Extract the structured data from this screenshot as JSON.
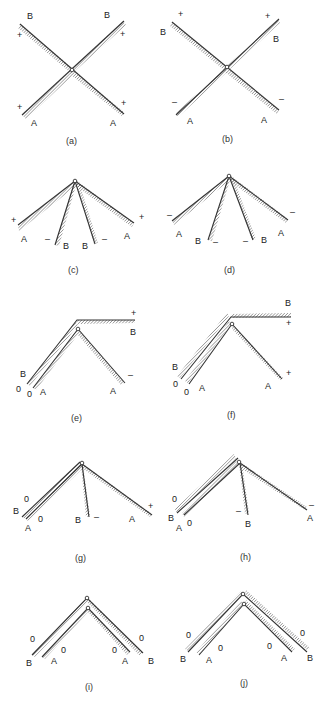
{
  "figure": {
    "panels": [
      {
        "id": "a",
        "caption": "(a)",
        "labels": {
          "top_left": "B",
          "top_right": "B",
          "bottom_left": "A",
          "bottom_right": "A",
          "sign_tl": "+",
          "sign_tr": "+",
          "sign_bl": "+",
          "sign_br": "+"
        }
      },
      {
        "id": "b",
        "caption": "(b)",
        "labels": {
          "top_left": "B",
          "top_right": "B",
          "bottom_left": "A",
          "bottom_right": "A",
          "sign_tl": "+",
          "sign_tr": "+",
          "sign_bl": "–",
          "sign_br": "–"
        }
      },
      {
        "id": "c",
        "caption": "(c)",
        "labels": {
          "a_left": "A",
          "b_left": "B",
          "b_right": "B",
          "a_right": "A",
          "sign_a_left": "+",
          "sign_b_left": "–",
          "sign_b_right": "–",
          "sign_a_right": "+"
        }
      },
      {
        "id": "d",
        "caption": "(d)",
        "labels": {
          "a_left": "A",
          "b_left": "B",
          "b_right": "B",
          "a_right": "A",
          "sign_a_left": "–",
          "sign_b_left": "–",
          "sign_b_right": "–",
          "sign_a_right": "–"
        }
      },
      {
        "id": "e",
        "caption": "(e)",
        "labels": {
          "b_left": "B",
          "a_left": "A",
          "b_right": "B",
          "a_right": "A",
          "sign_b_left": "0",
          "sign_a_left": "0",
          "sign_b_right": "+",
          "sign_a_right": "–"
        }
      },
      {
        "id": "f",
        "caption": "(f)",
        "labels": {
          "b_left": "B",
          "a_left": "A",
          "b_right": "B",
          "a_right": "A",
          "sign_b_left": "0",
          "sign_a_left": "0",
          "sign_b_right": "+",
          "sign_a_right": "+"
        }
      },
      {
        "id": "g",
        "caption": "(g)",
        "labels": {
          "b_left": "B",
          "a_left": "A",
          "b_mid": "B",
          "a_right": "A",
          "sign_b_left": "0",
          "sign_a_left": "0",
          "sign_b_mid": "–",
          "sign_a_right": "+"
        }
      },
      {
        "id": "h",
        "caption": "(h)",
        "labels": {
          "b_left": "B",
          "a_left": "A",
          "b_mid": "B",
          "a_right": "A",
          "sign_b_left": "0",
          "sign_a_left": "0",
          "sign_b_mid": "–",
          "sign_a_right": "–"
        }
      },
      {
        "id": "i",
        "caption": "(i)",
        "labels": {
          "b_left": "B",
          "a_left": "A",
          "a_right": "A",
          "b_right": "B",
          "sign_b_left": "0",
          "sign_a_left": "0",
          "sign_a_right": "0",
          "sign_b_right": "0"
        }
      },
      {
        "id": "j",
        "caption": "(j)",
        "labels": {
          "b_left": "B",
          "a_left": "A",
          "a_right": "A",
          "b_right": "B",
          "sign_b_left": "0",
          "sign_a_left": "0",
          "sign_a_right": "0",
          "sign_b_right": "0"
        }
      }
    ]
  }
}
